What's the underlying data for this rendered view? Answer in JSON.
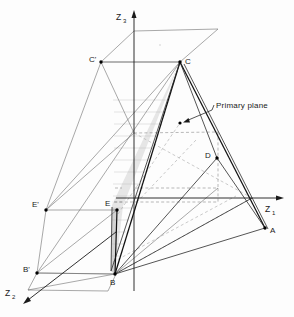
{
  "figure": {
    "type": "3d-geometric-diagram",
    "caption": ""
  },
  "axes": [
    {
      "name": "z3-axis",
      "label": "Z",
      "subscript": "3",
      "label_x": 118,
      "label_y": 18,
      "sub_x": 126,
      "sub_y": 20,
      "line": {
        "x1": 134,
        "y1": 290,
        "x2": 134,
        "y2": 14
      },
      "arrow": "up"
    },
    {
      "name": "z1-axis",
      "label": "Z",
      "subscript": "1",
      "label_x": 266,
      "label_y": 210,
      "sub_x": 274,
      "sub_y": 212,
      "line": {
        "x1": 115,
        "y1": 198,
        "x2": 281,
        "y2": 198
      },
      "arrow": "right"
    },
    {
      "name": "z2-axis",
      "label": "Z",
      "subscript": "2",
      "label_x": 6,
      "label_y": 296,
      "sub_x": 14,
      "sub_y": 298,
      "line": {
        "x1": 115,
        "y1": 232,
        "x2": 23,
        "y2": 304
      },
      "arrow": "down-left"
    }
  ],
  "vertices": [
    {
      "id": "C",
      "name": "vertex-c",
      "x": 180,
      "y": 62,
      "label": "C",
      "label_x": 185,
      "label_y": 62,
      "dot": true
    },
    {
      "id": "Cp",
      "name": "vertex-c-prime",
      "x": 101,
      "y": 62,
      "label": "C'",
      "label_x": 88,
      "label_y": 61,
      "dot": true
    },
    {
      "id": "E",
      "name": "vertex-e",
      "x": 117,
      "y": 210,
      "label": "E",
      "label_x": 106,
      "label_y": 206,
      "dot": true
    },
    {
      "id": "Ep",
      "name": "vertex-e-prime",
      "x": 46,
      "y": 210,
      "label": "E'",
      "label_x": 33,
      "label_y": 208,
      "dot": true
    },
    {
      "id": "B",
      "name": "vertex-b",
      "x": 115,
      "y": 274,
      "label": "B",
      "label_x": 111,
      "label_y": 284,
      "dot": true
    },
    {
      "id": "Bp",
      "name": "vertex-b-prime",
      "x": 37,
      "y": 273,
      "label": "B'",
      "label_x": 24,
      "label_y": 272,
      "dot": true
    },
    {
      "id": "A",
      "name": "vertex-a",
      "x": 265,
      "y": 228,
      "label": "A",
      "label_x": 270,
      "label_y": 232,
      "dot": true
    },
    {
      "id": "D",
      "name": "vertex-d",
      "x": 217,
      "y": 158,
      "label": "D",
      "label_x": 206,
      "label_y": 157,
      "dot": true
    }
  ],
  "annotation": {
    "name": "primary-plane-annotation",
    "text": "Primary plane",
    "text_x": 214,
    "text_y": 108,
    "pointer": {
      "x1": 211,
      "y1": 111,
      "x2": 184,
      "y2": 122
    },
    "marker": {
      "x": 180,
      "y": 123
    }
  },
  "shaded_region": {
    "name": "primary-plane-shaded-triangle",
    "points": "180,62 122,207 115,274 111,270 113,206",
    "fill": "#e3e3e3"
  },
  "top_plane": {
    "name": "top-parallelogram",
    "points": "134,31 218,29 180,62 101,62"
  },
  "bottom_plane": {
    "name": "bottom-parallelogram",
    "points": "37,273 115,274 108,291 28,290"
  },
  "colors": {
    "stroke_dark": "#111111",
    "stroke_mid": "#2a2a2a",
    "stroke_light": "#6e6e6e",
    "dash": "#8a8a8a",
    "shade": "#e3e3e3",
    "background": "#fdfdfd"
  }
}
